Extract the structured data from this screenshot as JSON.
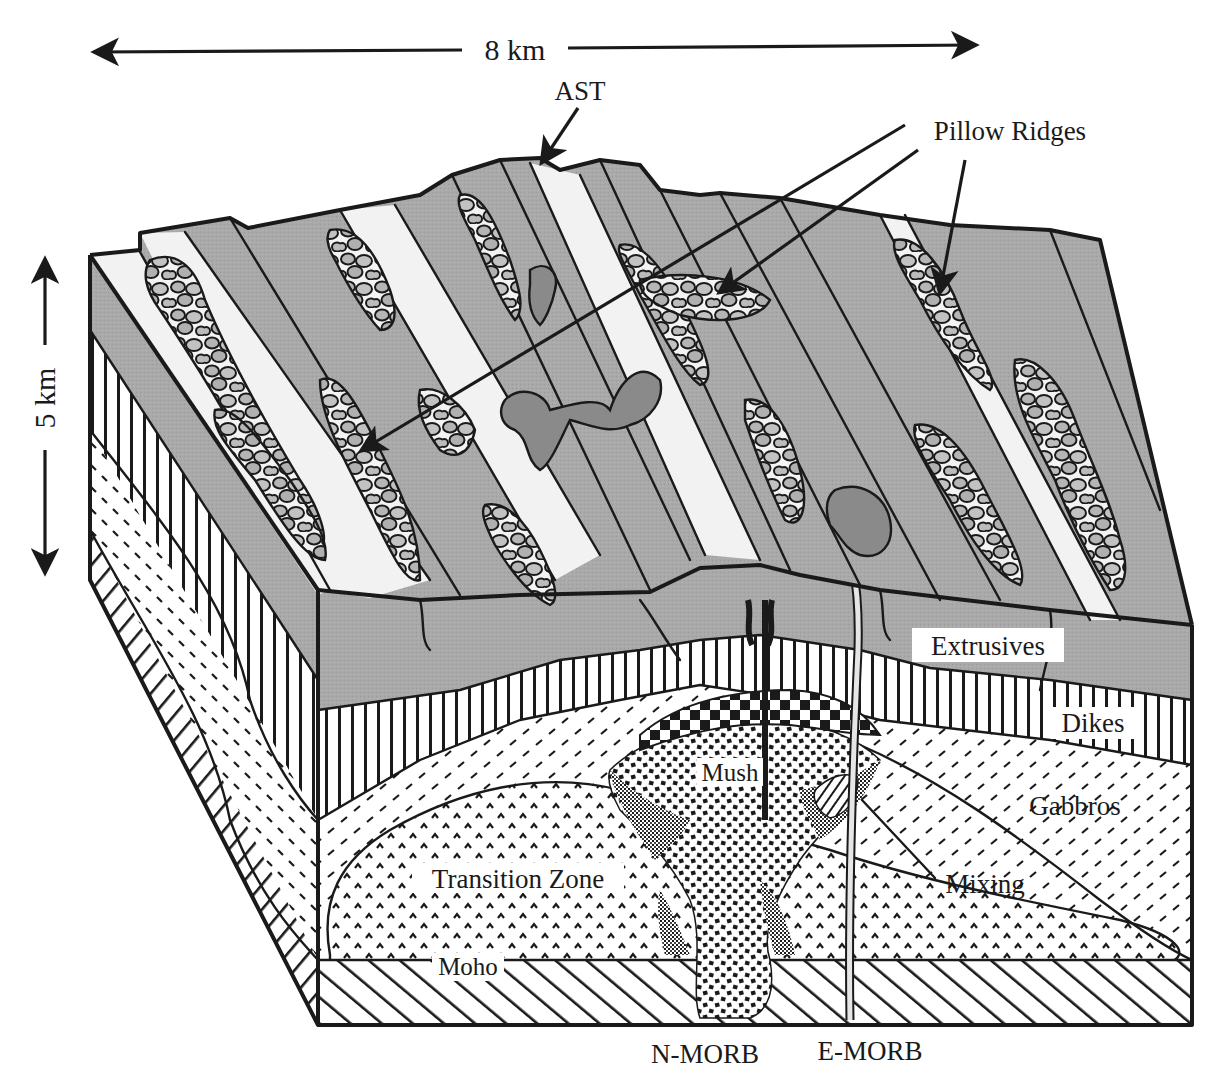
{
  "figure": {
    "scale_horizontal": "8 km",
    "scale_vertical": "5 km"
  },
  "labels": {
    "ast": "AST",
    "pillow_ridges": "Pillow Ridges",
    "extrusives": "Extrusives",
    "dikes": "Dikes",
    "gabbros": "Gabbros",
    "mush": "Mush",
    "mixing": "Mixing",
    "transition_zone": "Transition Zone",
    "moho": "Moho",
    "n_morb": "N-MORB",
    "e_morb": "E-MORB"
  },
  "layers": [
    {
      "name": "Extrusives",
      "pattern": "gray-fill",
      "color": "#a9a9a9"
    },
    {
      "name": "Dikes",
      "pattern": "vertical-lines"
    },
    {
      "name": "Gabbros",
      "pattern": "dashes"
    },
    {
      "name": "Transition Zone",
      "pattern": "chevrons"
    },
    {
      "name": "Mantle",
      "pattern": "diagonal-hatch"
    },
    {
      "name": "Melt lens",
      "pattern": "checkerboard"
    },
    {
      "name": "Mush",
      "pattern": "dense-squares"
    }
  ],
  "colors": {
    "ink": "#1a1a1a",
    "seafloor_gray": "#a9a9a9",
    "dark_gray": "#8a8a8a",
    "light_flow": "#f2f2f2",
    "background": "#ffffff"
  }
}
